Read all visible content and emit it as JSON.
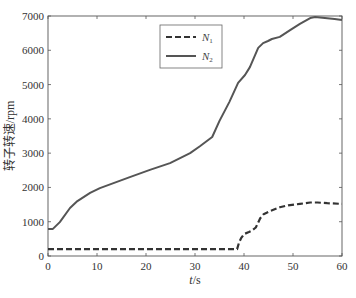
{
  "chart_data": {
    "type": "line",
    "title": "",
    "xlabel": "t/s",
    "xlabel_italic_part": "t",
    "xlabel_rest": "/s",
    "ylabel": "转子转速/rpm",
    "xlim": [
      0,
      60
    ],
    "ylim": [
      0,
      7000
    ],
    "xticks": [
      0,
      10,
      20,
      30,
      40,
      50,
      60
    ],
    "yticks": [
      0,
      1000,
      2000,
      3000,
      4000,
      5000,
      6000,
      7000
    ],
    "grid": false,
    "legend_position": "upper center",
    "series": [
      {
        "name": "N1",
        "label_main": "N",
        "label_sub": "1",
        "style": "dashed",
        "color": "#333333",
        "x": [
          0,
          10,
          20,
          30,
          38.6,
          39.0,
          39.4,
          40.0,
          41.0,
          41.6,
          42.4,
          43.3,
          44.0,
          45.3,
          47.3,
          49.0,
          51.4,
          53.5,
          55.0,
          57.0,
          60.0
        ],
        "y": [
          200,
          200,
          200,
          200,
          200,
          400,
          520,
          640,
          700,
          740,
          830,
          1100,
          1220,
          1310,
          1420,
          1480,
          1520,
          1560,
          1560,
          1540,
          1520
        ]
      },
      {
        "name": "N2",
        "label_main": "N",
        "label_sub": "2",
        "style": "solid",
        "color": "#555555",
        "x": [
          0,
          1.0,
          2.4,
          4.5,
          6.0,
          8.6,
          10.6,
          16.7,
          20.8,
          24.9,
          29.0,
          31.0,
          33.5,
          35.0,
          37.0,
          38.8,
          40.2,
          41.2,
          42.9,
          43.9,
          44.9,
          45.7,
          47.3,
          49.4,
          51.4,
          53.5,
          54.5,
          56.5,
          58.5,
          60.0
        ],
        "y": [
          790,
          790,
          990,
          1400,
          1600,
          1840,
          1980,
          2300,
          2510,
          2710,
          3000,
          3200,
          3470,
          3940,
          4490,
          5050,
          5280,
          5510,
          6070,
          6210,
          6270,
          6330,
          6390,
          6590,
          6770,
          6940,
          6970,
          6940,
          6910,
          6880
        ]
      }
    ]
  },
  "plot": {
    "left": 48,
    "right": 342,
    "top": 16,
    "bottom": 256,
    "legend_box": {
      "x": 160,
      "y": 25,
      "w": 62,
      "h": 43
    }
  }
}
